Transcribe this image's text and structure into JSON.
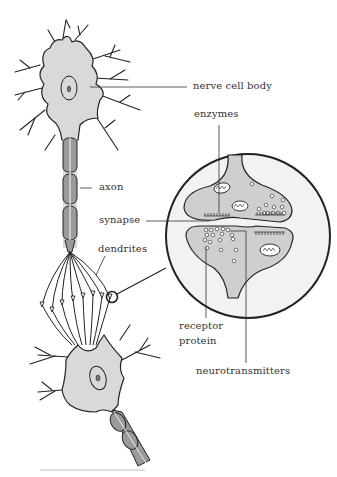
{
  "colors": {
    "cell_fill": "#d9d9d9",
    "axon_segment": "#9a9a9a",
    "outline": "#222222",
    "magnifier_fill": "#f2f2f2",
    "label_text": "#333333"
  },
  "labels": {
    "nerve_cell_body": "nerve cell body",
    "enzymes": "enzymes",
    "axon": "axon",
    "synapse": "synapse",
    "dendrites": "dendrites",
    "receptor_protein_line1": "receptor",
    "receptor_protein_line2": "protein",
    "neurotransmitters": "neurotransmitters"
  }
}
